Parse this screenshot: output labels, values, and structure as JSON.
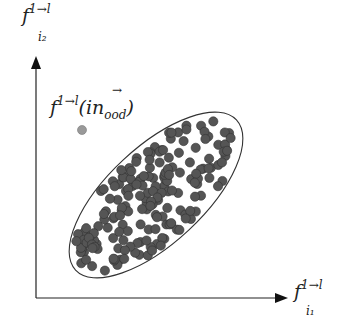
{
  "diagram": {
    "y_axis_label": {
      "base": "f",
      "sub": "i₂",
      "sup": "1→l"
    },
    "x_axis_label": {
      "base": "f",
      "sub": "i₁",
      "sup": "1→l"
    },
    "ood_label": {
      "base": "f",
      "sup": "1→l",
      "paren_open": "(",
      "arg": "in",
      "arg_sub": "ood",
      "arrow": "→",
      "paren_close": ")"
    },
    "ood_point": {
      "x": 82,
      "y": 130,
      "color": "#999999"
    },
    "cluster": {
      "color": "#555555",
      "ellipse": {
        "cx": 156,
        "cy": 195,
        "rx": 110,
        "ry": 48,
        "angle": -43
      }
    }
  }
}
